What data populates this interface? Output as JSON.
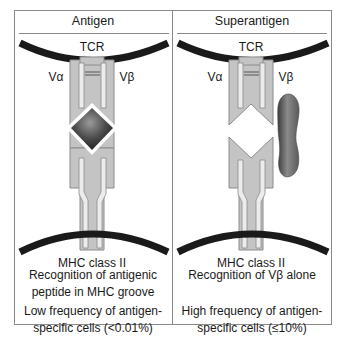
{
  "panels": [
    {
      "title": "Antigen",
      "tcr_label": "TCR",
      "v_alpha_label": "Vα",
      "v_beta_label": "Vβ",
      "mhc_label": "MHC class II",
      "recognition_text": [
        "Recognition of antigenic",
        "peptide in MHC groove"
      ],
      "frequency_text": [
        "Low frequency of antigen-",
        "specific cells (<0.01%)"
      ]
    },
    {
      "title": "Superantigen",
      "tcr_label": "TCR",
      "v_alpha_label": "Vα",
      "v_beta_label": "Vβ",
      "mhc_label": "MHC class II",
      "recognition_text": [
        "Recognition of Vβ alone"
      ],
      "frequency_text": [
        "High frequency of antigen-",
        "specific cells (≤10%)"
      ]
    }
  ],
  "colors": {
    "frame": "#8a8a8a",
    "membrane": "#1a1a1a",
    "molecule_fill": "#c4c4c4",
    "molecule_stroke": "#8c8c8c",
    "inner_bar": "#ececec",
    "antigen_dark": "#2a2a2a",
    "superantigen_mid": "#6e6e6e"
  }
}
